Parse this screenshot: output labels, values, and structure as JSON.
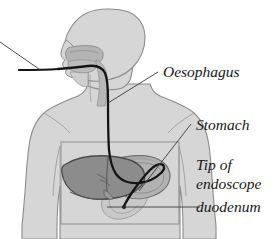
{
  "figure": {
    "kind": "anatomical-diagram",
    "background_color": "#ffffff"
  },
  "labels": {
    "oesophagus": "Oesophagus",
    "stomach": "Stomach",
    "tip_of": "Tip of",
    "endoscope": "endoscope",
    "duodenum": "duodenum"
  },
  "anatomy": {
    "body_label": "Patient body silhouette",
    "head_label": "Head and neck profile",
    "airway_label": "Nasal and oral cavity",
    "liver_label": "Liver",
    "stomach_label": "Stomach",
    "duodenum_label": "Duodenum",
    "abdomen_box_label": "Abdominal region outline"
  },
  "instrument": {
    "endoscope_label": "Endoscope tube",
    "external_lead_label": "External endoscope cable",
    "tip_label": "Endoscope tip"
  },
  "leaders": {
    "oesophagus_leader": "Leader line to oesophagus",
    "stomach_leader": "Leader line to stomach",
    "duodenum_leader": "Leader line to duodenum",
    "external_leader": "Leader line to external cable"
  },
  "colors": {
    "background": "#ffffff",
    "body_fill": "#d6d6d6",
    "body_stroke": "#8d8d8d",
    "airway_fill": "#b4b4b4",
    "airway_stroke": "#8a8a8a",
    "liver_fill": "#8c8c8c",
    "liver_stroke": "#4a4a4a",
    "stomach_fill": "#b2b2b2",
    "stomach_stroke": "#6e6e6e",
    "duodenum_fill": "#c6c6c6",
    "duodenum_stroke": "#9a9a9a",
    "endoscope": "#141414",
    "leader_line": "#3a3a3a",
    "text": "#171717"
  }
}
